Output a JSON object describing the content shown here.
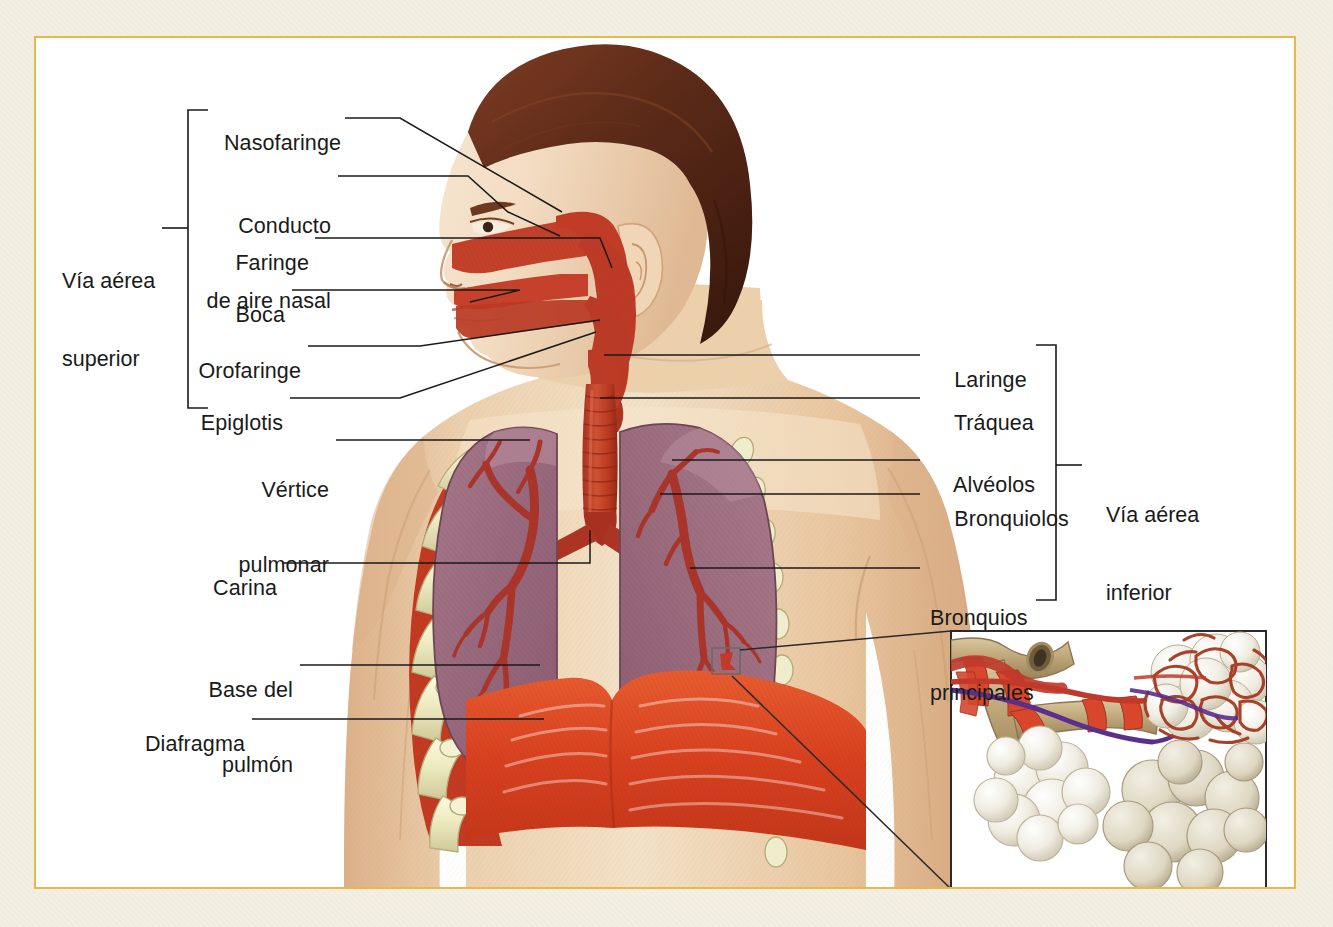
{
  "figure": {
    "language": "es",
    "frame_color": "#e8b84a",
    "paper_color": "#f3efe2",
    "plate_color": "#ffffff"
  },
  "groups": {
    "upper": {
      "label_line1": "Vía aérea",
      "label_line2": "superior"
    },
    "lower": {
      "label_line1": "Vía aérea",
      "label_line2": "inferior"
    }
  },
  "labels_left": [
    {
      "id": "nasofaringe",
      "text": "Nasofaringe",
      "text2": ""
    },
    {
      "id": "conducto",
      "text": "Conducto",
      "text2": "de aire nasal"
    },
    {
      "id": "faringe",
      "text": "Faringe",
      "text2": ""
    },
    {
      "id": "boca",
      "text": "Boca",
      "text2": ""
    },
    {
      "id": "orofaringe",
      "text": "Orofaringe",
      "text2": ""
    },
    {
      "id": "epiglotis",
      "text": "Epiglotis",
      "text2": ""
    },
    {
      "id": "vertice",
      "text": "Vértice",
      "text2": "pulmonar"
    },
    {
      "id": "carina",
      "text": "Carina",
      "text2": ""
    },
    {
      "id": "base",
      "text": "Base del",
      "text2": "pulmón"
    },
    {
      "id": "diafragma",
      "text": "Diafragma",
      "text2": ""
    }
  ],
  "labels_right": [
    {
      "id": "laringe",
      "text": "Laringe",
      "text2": ""
    },
    {
      "id": "traquea",
      "text": "Tráquea",
      "text2": ""
    },
    {
      "id": "alveolos",
      "text": "Alvéolos",
      "text2": ""
    },
    {
      "id": "bronquiolos",
      "text": "Bronquiolos",
      "text2": ""
    },
    {
      "id": "bronquios",
      "text": "Bronquios",
      "text2": "principales"
    }
  ],
  "inset": {
    "name": "detalle-alveolar",
    "contents": "bronquiolo terminal con sacos alveolares y red capilar"
  },
  "colors": {
    "skin": "#e7c49c",
    "skin_light": "#f0dcc0",
    "hair": "#5a2d1c",
    "airway_red": "#c0392b",
    "lung": "#9b6f82",
    "bronchi": "#a8342a",
    "rib": "#e9e7c4",
    "intercostal": "#c0392b",
    "diaphragm": "#e0472a",
    "leader": "#1a1a1a"
  }
}
